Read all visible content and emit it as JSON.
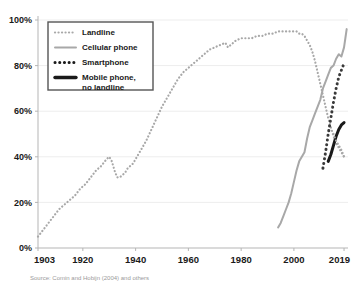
{
  "chart_data": {
    "type": "line",
    "title": "",
    "subtitle": "",
    "xlabel": "",
    "ylabel": "",
    "xlim": [
      1903,
      2019
    ],
    "ylim": [
      0,
      100
    ],
    "grid": true,
    "legend_position": "top-left",
    "source": "Source: Comin and Hobijn (2004) and others",
    "x_ticks": [
      "1903",
      "1920",
      "1940",
      "1960",
      "1980",
      "2000",
      "2019"
    ],
    "x_tick_values": [
      1903,
      1920,
      1940,
      1960,
      1980,
      2000,
      2019
    ],
    "y_ticks": [
      "0%",
      "20%",
      "40%",
      "60%",
      "80%",
      "100%"
    ],
    "y_tick_values": [
      0,
      20,
      40,
      60,
      80,
      100
    ],
    "series": [
      {
        "name": "Landline",
        "style": "dotted",
        "color": "#a8a8a8",
        "width": 2.2,
        "points": [
          [
            1903,
            5
          ],
          [
            1905,
            8
          ],
          [
            1907,
            11
          ],
          [
            1909,
            14
          ],
          [
            1911,
            17
          ],
          [
            1913,
            19
          ],
          [
            1915,
            21
          ],
          [
            1917,
            23
          ],
          [
            1919,
            26
          ],
          [
            1921,
            28
          ],
          [
            1923,
            31
          ],
          [
            1925,
            34
          ],
          [
            1927,
            36
          ],
          [
            1929,
            39
          ],
          [
            1930,
            40
          ],
          [
            1931,
            38
          ],
          [
            1932,
            34
          ],
          [
            1933,
            31
          ],
          [
            1934,
            31
          ],
          [
            1935,
            32
          ],
          [
            1936,
            33
          ],
          [
            1937,
            35
          ],
          [
            1938,
            36
          ],
          [
            1939,
            37
          ],
          [
            1940,
            39
          ],
          [
            1942,
            43
          ],
          [
            1944,
            47
          ],
          [
            1946,
            52
          ],
          [
            1948,
            57
          ],
          [
            1950,
            62
          ],
          [
            1952,
            66
          ],
          [
            1954,
            70
          ],
          [
            1956,
            74
          ],
          [
            1958,
            77
          ],
          [
            1960,
            79
          ],
          [
            1962,
            81
          ],
          [
            1964,
            83
          ],
          [
            1966,
            85
          ],
          [
            1968,
            87
          ],
          [
            1970,
            88
          ],
          [
            1972,
            89
          ],
          [
            1974,
            90
          ],
          [
            1975,
            88
          ],
          [
            1976,
            89
          ],
          [
            1977,
            90
          ],
          [
            1978,
            91
          ],
          [
            1980,
            92
          ],
          [
            1982,
            92
          ],
          [
            1984,
            92
          ],
          [
            1986,
            93
          ],
          [
            1988,
            93
          ],
          [
            1990,
            94
          ],
          [
            1992,
            94
          ],
          [
            1994,
            95
          ],
          [
            1996,
            95
          ],
          [
            1998,
            95
          ],
          [
            2000,
            95
          ],
          [
            2001,
            95
          ],
          [
            2002,
            94
          ],
          [
            2003,
            94
          ],
          [
            2004,
            93
          ],
          [
            2005,
            91
          ],
          [
            2006,
            89
          ],
          [
            2007,
            86
          ],
          [
            2008,
            82
          ],
          [
            2009,
            77
          ],
          [
            2010,
            72
          ],
          [
            2011,
            67
          ],
          [
            2012,
            62
          ],
          [
            2013,
            57
          ],
          [
            2014,
            53
          ],
          [
            2015,
            49
          ],
          [
            2016,
            46
          ],
          [
            2017,
            44
          ],
          [
            2018,
            42
          ],
          [
            2019,
            40
          ]
        ]
      },
      {
        "name": "Cellular phone",
        "style": "solid",
        "color": "#a8a8a8",
        "width": 2.0,
        "points": [
          [
            1994,
            9
          ],
          [
            1995,
            11
          ],
          [
            1996,
            14
          ],
          [
            1997,
            17
          ],
          [
            1998,
            20
          ],
          [
            1999,
            24
          ],
          [
            2000,
            29
          ],
          [
            2001,
            34
          ],
          [
            2002,
            38
          ],
          [
            2003,
            40
          ],
          [
            2004,
            42
          ],
          [
            2005,
            48
          ],
          [
            2006,
            53
          ],
          [
            2007,
            56
          ],
          [
            2008,
            59
          ],
          [
            2009,
            62
          ],
          [
            2010,
            65
          ],
          [
            2011,
            70
          ],
          [
            2012,
            73
          ],
          [
            2013,
            76
          ],
          [
            2014,
            79
          ],
          [
            2015,
            80
          ],
          [
            2016,
            83
          ],
          [
            2017,
            85
          ],
          [
            2018,
            84
          ],
          [
            2019,
            88
          ],
          [
            2019.5,
            92
          ],
          [
            2020,
            96
          ]
        ]
      },
      {
        "name": "Smartphone",
        "style": "dotted",
        "color": "#3a3a3a",
        "width": 3.0,
        "points": [
          [
            2011,
            35
          ],
          [
            2012,
            42
          ],
          [
            2013,
            50
          ],
          [
            2014,
            57
          ],
          [
            2015,
            64
          ],
          [
            2016,
            70
          ],
          [
            2017,
            75
          ],
          [
            2018,
            78
          ],
          [
            2019,
            81
          ]
        ]
      },
      {
        "name": "Mobile phone, no landline",
        "style": "solid",
        "color": "#1a1a1a",
        "width": 3.0,
        "points": [
          [
            2013,
            38
          ],
          [
            2014,
            41
          ],
          [
            2015,
            45
          ],
          [
            2016,
            49
          ],
          [
            2017,
            52
          ],
          [
            2018,
            54
          ],
          [
            2019,
            55
          ]
        ]
      },
      {
        "name": "Landline tail",
        "style": "dotted",
        "color": "#a8a8a8",
        "width": 2.2,
        "hidden_from_legend": true,
        "points": [
          [
            2015,
            50
          ],
          [
            2016,
            47
          ],
          [
            2017,
            45
          ],
          [
            2018,
            43
          ],
          [
            2019,
            40
          ]
        ]
      }
    ]
  },
  "legend": {
    "items": [
      {
        "label": "Landline",
        "swatch": "dotted-light"
      },
      {
        "label": "Cellular phone",
        "swatch": "solid-light"
      },
      {
        "label": "Smartphone",
        "swatch": "dotted-dark"
      },
      {
        "label": "Mobile phone,",
        "label2": "no landline",
        "swatch": "solid-dark"
      }
    ]
  },
  "colors": {
    "background": "#ffffff",
    "grid": "#ededed",
    "axis": "#b5b5b5",
    "text": "#1a1a1a",
    "source_text": "#9a9a9a",
    "light_series": "#a8a8a8",
    "dark_series": "#1a1a1a"
  }
}
